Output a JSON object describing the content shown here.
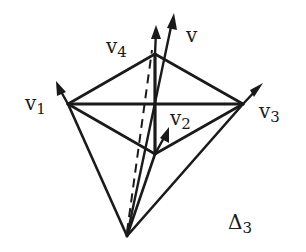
{
  "diagram": {
    "title": "Δ3",
    "title_base": "Δ",
    "title_sub": "3",
    "labels": {
      "v": {
        "base": "v",
        "sub": ""
      },
      "v1": {
        "base": "v",
        "sub": "1"
      },
      "v2": {
        "base": "v",
        "sub": "2"
      },
      "v3": {
        "base": "v",
        "sub": "3"
      },
      "v4": {
        "base": "v",
        "sub": "4"
      }
    },
    "colors": {
      "ink": "#1a1a1a",
      "background": "#ffffff"
    }
  }
}
